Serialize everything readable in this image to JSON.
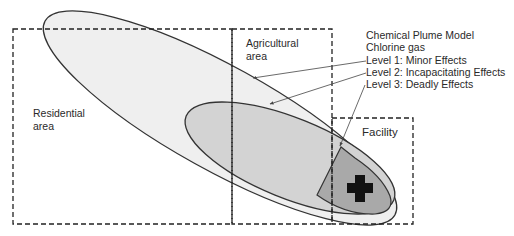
{
  "diagram": {
    "title": "Chemical Plume Model",
    "subtitle": "Chlorine gas",
    "legend": [
      {
        "level": 1,
        "label": "Level 1: Minor Effects",
        "fill": "#eeeeee"
      },
      {
        "level": 2,
        "label": "Level 2: Incapacitating Effects",
        "fill": "#d2d2d2"
      },
      {
        "level": 3,
        "label": "Level 3: Deadly Effects",
        "fill": "#a8a8a8"
      }
    ],
    "areas": [
      {
        "name": "residential",
        "label_line1": "Residential",
        "label_line2": "area"
      },
      {
        "name": "agricultural",
        "label_line1": "Agricultural",
        "label_line2": "area"
      },
      {
        "name": "facility",
        "label_line1": "Facility"
      }
    ],
    "source_marker": {
      "icon": "cross-icon",
      "color": "#111111"
    },
    "colors": {
      "outline": "#333333",
      "dash": "#222222",
      "arrow": "#444444"
    }
  }
}
